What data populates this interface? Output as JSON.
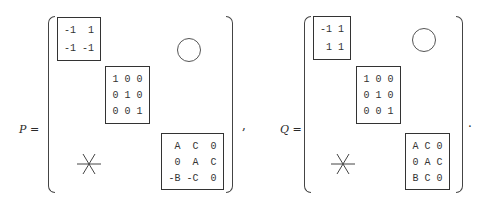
{
  "equation": {
    "P": {
      "label": "P =",
      "block1": {
        "rows": [
          "-1  1",
          "-1 -1"
        ]
      },
      "block2": {
        "rows": [
          "1 0 0",
          "0 1 0",
          "0 0 1"
        ]
      },
      "block3": {
        "rows": [
          " A  C  0",
          " 0  A  C",
          "-B -C  0"
        ]
      },
      "upper_symbol": "circle (zero block)",
      "lower_symbol": "asterisk (arbitrary block)"
    },
    "separator": ",",
    "Q": {
      "label": "Q =",
      "block1": {
        "rows": [
          "-1 1",
          " 1 1"
        ]
      },
      "block2": {
        "rows": [
          "1 0 0",
          "0 1 0",
          "0 0 1"
        ]
      },
      "block3": {
        "rows": [
          "A C 0",
          "0 A C",
          "B C 0"
        ]
      },
      "upper_symbol": "circle (zero block)",
      "lower_symbol": "asterisk (arbitrary block)"
    },
    "terminator": "."
  }
}
